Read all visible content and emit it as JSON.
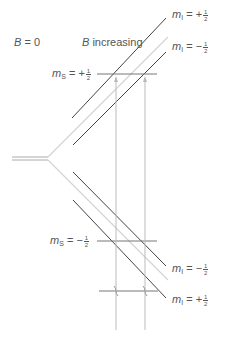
{
  "labels": {
    "b_zero": {
      "var": "B",
      "eq": " = 0"
    },
    "b_increasing": {
      "var": "B",
      "text": " increasing"
    },
    "ms_plus": {
      "var": "m",
      "sub": "S",
      "eq": " = +",
      "num": "1",
      "den": "2"
    },
    "ms_minus": {
      "var": "m",
      "sub": "S",
      "eq": " = −",
      "num": "1",
      "den": "2"
    },
    "mi_top_plus": {
      "var": "m",
      "sub": "I",
      "eq": " = +",
      "num": "1",
      "den": "2"
    },
    "mi_top_minus": {
      "var": "m",
      "sub": "I",
      "eq": " = −",
      "num": "1",
      "den": "2"
    },
    "mi_bottom_minus": {
      "var": "m",
      "sub": "I",
      "eq": " = −",
      "num": "1",
      "den": "2"
    },
    "mi_bottom_plus": {
      "var": "m",
      "sub": "I",
      "eq": " = +",
      "num": "1",
      "den": "2"
    }
  },
  "colors": {
    "dark_line": "#444444",
    "light_line": "#cfcfcf",
    "arrow_line": "#bdbdbd"
  }
}
